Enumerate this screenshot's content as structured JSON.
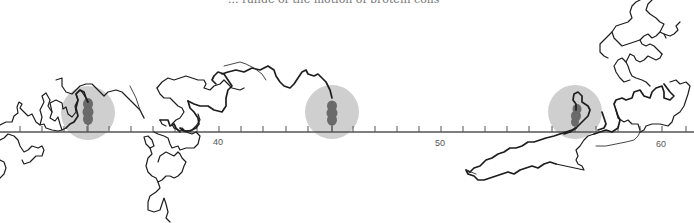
{
  "figure": {
    "caption_partial": "... range of the motion of protein coils",
    "axis": {
      "y": 132,
      "x_start": 0,
      "x_end": 694,
      "color": "#555555",
      "tick_spacing_px": 22.1,
      "first_tick_x": 20,
      "labels": [
        {
          "text": "40",
          "x": 218
        },
        {
          "text": "50",
          "x": 440
        },
        {
          "text": "60",
          "x": 661
        }
      ]
    },
    "sites": [
      {
        "name": "site-1",
        "cx": 88,
        "cy": 113,
        "r": 27,
        "blob_x": 88,
        "blob_top": 98,
        "blob_bottom": 127
      },
      {
        "name": "site-2",
        "cx": 332,
        "cy": 112,
        "r": 27,
        "blob_x": 332,
        "blob_top": 101,
        "blob_bottom": 127
      },
      {
        "name": "site-3",
        "cx": 575,
        "cy": 112,
        "r": 27,
        "blob_x": 576,
        "blob_top": 105,
        "blob_bottom": 127
      }
    ],
    "colors": {
      "halo": "#cfcfcf",
      "blob": "#6a6a6a",
      "chain": "#1e1e1e"
    }
  }
}
